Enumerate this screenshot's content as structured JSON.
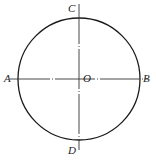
{
  "diagram": {
    "type": "circle-with-centerlines",
    "circle": {
      "cx": 79,
      "cy": 79,
      "r": 61,
      "stroke": "#1a1a1a"
    },
    "horizontal_line": {
      "x1": 10,
      "x2": 148,
      "y": 79
    },
    "vertical_line": {
      "y1": 4,
      "y2": 150,
      "x": 79
    },
    "line_color": "#333333",
    "points": {
      "A": {
        "label": "A",
        "x": 4,
        "y": 73
      },
      "B": {
        "label": "B",
        "x": 143,
        "y": 73
      },
      "C": {
        "label": "C",
        "x": 68,
        "y": 3
      },
      "D": {
        "label": "D",
        "x": 68,
        "y": 145
      },
      "O": {
        "label": "O",
        "x": 83,
        "y": 73
      }
    }
  }
}
